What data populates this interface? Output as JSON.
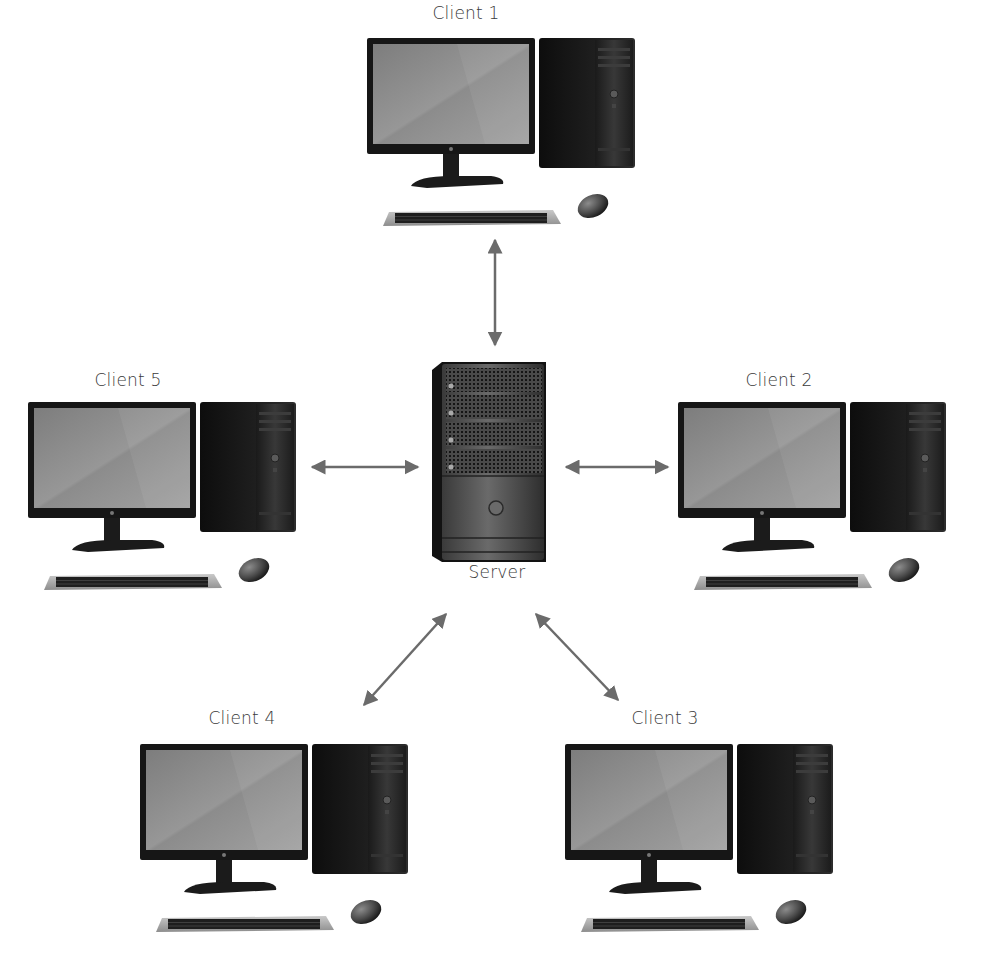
{
  "diagram": {
    "type": "client-server network (star topology)",
    "server": {
      "label": "Server",
      "icon": "server-tower-icon"
    },
    "clients": [
      {
        "id": 1,
        "label": "Client 1",
        "icon": "desktop-computer-icon"
      },
      {
        "id": 2,
        "label": "Client 2",
        "icon": "desktop-computer-icon"
      },
      {
        "id": 3,
        "label": "Client 3",
        "icon": "desktop-computer-icon"
      },
      {
        "id": 4,
        "label": "Client 4",
        "icon": "desktop-computer-icon"
      },
      {
        "id": 5,
        "label": "Client 5",
        "icon": "desktop-computer-icon"
      }
    ],
    "connections": [
      {
        "from": "Server",
        "to": "Client 1",
        "style": "bidirectional-arrow"
      },
      {
        "from": "Server",
        "to": "Client 2",
        "style": "bidirectional-arrow"
      },
      {
        "from": "Server",
        "to": "Client 3",
        "style": "bidirectional-arrow"
      },
      {
        "from": "Server",
        "to": "Client 4",
        "style": "bidirectional-arrow"
      },
      {
        "from": "Server",
        "to": "Client 5",
        "style": "bidirectional-arrow"
      }
    ],
    "colors": {
      "arrow": "#6b6b6b",
      "label_text": "#3a3a3a",
      "device_body": "#1a1a1a",
      "screen": "#8a8a8a",
      "background": "#ffffff"
    }
  }
}
